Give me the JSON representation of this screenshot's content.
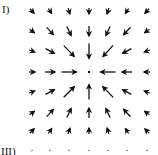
{
  "panels": [
    {
      "label": "I)"
    },
    {
      "label": "III)"
    }
  ],
  "field": {
    "type": "vector-field-sink",
    "grid_cols": 7,
    "grid_rows": 7,
    "col_x": [
      32,
      50,
      69,
      89,
      108,
      127,
      147
    ],
    "row_y": [
      11,
      31,
      51,
      72,
      92,
      113,
      131
    ],
    "center": [
      89,
      72
    ],
    "arrow_color": "#111111",
    "direction": "toward-center"
  },
  "partial_row": {
    "y": 151,
    "col_x": [
      32,
      50,
      69,
      89,
      108,
      127,
      147
    ]
  }
}
